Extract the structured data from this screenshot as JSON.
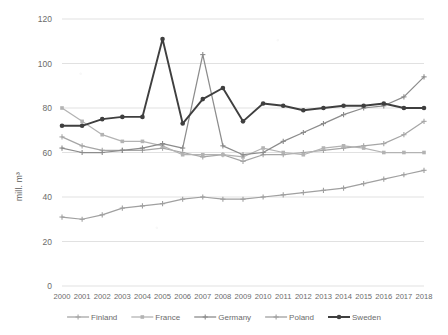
{
  "chart_data": {
    "type": "line",
    "title": "",
    "xlabel": "",
    "ylabel": "mill. m³",
    "grid": "horizontal",
    "legend_position": "bottom",
    "xlim": [
      2000,
      2018
    ],
    "ylim": [
      0,
      120
    ],
    "ytick_step": 20,
    "yticks": [
      "0",
      "20",
      "40",
      "60",
      "80",
      "100",
      "120"
    ],
    "categories": [
      "2000",
      "2001",
      "2002",
      "2003",
      "2004",
      "2005",
      "2006",
      "2007",
      "2008",
      "2009",
      "2010",
      "2011",
      "2012",
      "2013",
      "2014",
      "2015",
      "2016",
      "2017",
      "2018"
    ],
    "series": [
      {
        "name": "Finland",
        "color": "#a6a6a6",
        "marker": "cross",
        "values": [
          67,
          63,
          61,
          61,
          61,
          62,
          60,
          58,
          59,
          56,
          59,
          59,
          60,
          61,
          62,
          63,
          64,
          68,
          74
        ]
      },
      {
        "name": "France",
        "color": "#b3b3b3",
        "marker": "square",
        "values": [
          80,
          74,
          68,
          65,
          65,
          63,
          59,
          59,
          59,
          58,
          62,
          60,
          59,
          62,
          63,
          62,
          60,
          60,
          60
        ]
      },
      {
        "name": "Germany",
        "color": "#8c8c8c",
        "marker": "cross",
        "values": [
          62,
          60,
          60,
          61,
          62,
          64,
          62,
          64,
          63,
          59,
          60,
          65,
          69,
          73,
          77,
          80,
          81,
          85,
          94
        ]
      },
      {
        "name": "Poland",
        "color": "#a0a0a0",
        "marker": "cross",
        "values": [
          31,
          30,
          32,
          35,
          36,
          37,
          39,
          40,
          39,
          39,
          40,
          41,
          42,
          43,
          44,
          46,
          48,
          50,
          52
        ]
      },
      {
        "name": "Sweden",
        "color": "#3f3f3f",
        "marker": "circle",
        "values": [
          72,
          72,
          75,
          76,
          76,
          111,
          73,
          84,
          89,
          74,
          82,
          81,
          79,
          80,
          81,
          81,
          82,
          80,
          80
        ]
      }
    ],
    "series_extra_note": {
      "germany_peak_year": "2007",
      "germany_peak_value": 104,
      "sweden_peak_year": "2005",
      "sweden_peak_value": 111
    }
  },
  "axis": {
    "y_title": "mill. m³"
  },
  "legend": {
    "items": [
      {
        "label": "Finland"
      },
      {
        "label": "France"
      },
      {
        "label": "Germany"
      },
      {
        "label": "Poland"
      },
      {
        "label": "Sweden"
      }
    ]
  }
}
